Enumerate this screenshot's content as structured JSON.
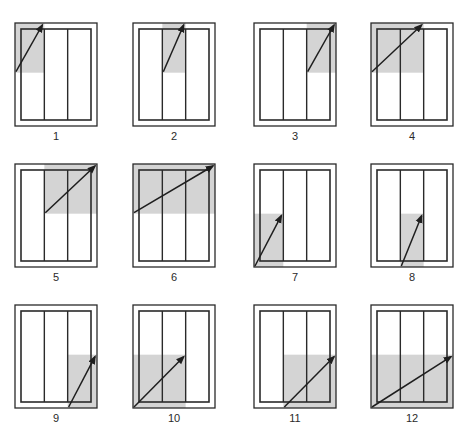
{
  "diagram": {
    "colors": {
      "frame": "#2a2a2a",
      "shade": "#d4d4d4",
      "arrow": "#1e1e1e",
      "background": "#ffffff"
    },
    "panels": [
      {
        "label": "1",
        "half": "top",
        "columns": [
          1,
          1
        ]
      },
      {
        "label": "2",
        "half": "top",
        "columns": [
          2,
          2
        ]
      },
      {
        "label": "3",
        "half": "top",
        "columns": [
          3,
          3
        ]
      },
      {
        "label": "4",
        "half": "top",
        "columns": [
          1,
          2
        ]
      },
      {
        "label": "5",
        "half": "top",
        "columns": [
          2,
          3
        ]
      },
      {
        "label": "6",
        "half": "top",
        "columns": [
          1,
          3
        ]
      },
      {
        "label": "7",
        "half": "bottom",
        "columns": [
          1,
          1
        ]
      },
      {
        "label": "8",
        "half": "bottom",
        "columns": [
          2,
          2
        ]
      },
      {
        "label": "9",
        "half": "bottom",
        "columns": [
          3,
          3
        ]
      },
      {
        "label": "10",
        "half": "bottom",
        "columns": [
          1,
          2
        ]
      },
      {
        "label": "11",
        "half": "bottom",
        "columns": [
          2,
          3
        ]
      },
      {
        "label": "12",
        "half": "bottom",
        "columns": [
          1,
          3
        ]
      }
    ]
  }
}
